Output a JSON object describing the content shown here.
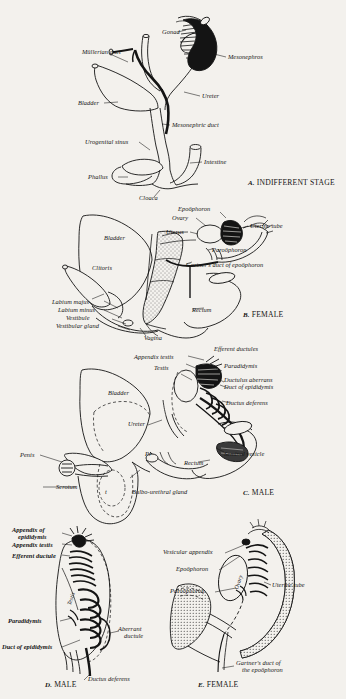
{
  "figure": {
    "background_color": "#f3f1ed",
    "ink_color": "#141414"
  },
  "panels": [
    {
      "id": "A",
      "caption_letter": "A.",
      "caption_text": "INDIFFERENT STAGE",
      "labels": [
        {
          "name": "gonad",
          "text": "Gonad"
        },
        {
          "name": "mullerian-duct",
          "text": "Müllerian duct"
        },
        {
          "name": "mesonephros",
          "text": "Mesonephros"
        },
        {
          "name": "bladder",
          "text": "Bladder"
        },
        {
          "name": "ureter",
          "text": "Ureter"
        },
        {
          "name": "mesonephric-duct",
          "text": "Mesonephric duct"
        },
        {
          "name": "urogenital-sinus",
          "text": "Urogenital sinus"
        },
        {
          "name": "intestine",
          "text": "Intestine"
        },
        {
          "name": "phallus",
          "text": "Phallus"
        },
        {
          "name": "cloaca",
          "text": "Cloaca"
        }
      ]
    },
    {
      "id": "B",
      "caption_letter": "B.",
      "caption_text": "FEMALE",
      "labels": [
        {
          "name": "epoophoron",
          "text": "Epoöphoron"
        },
        {
          "name": "ovary",
          "text": "Ovary"
        },
        {
          "name": "uterus",
          "text": "Uterus"
        },
        {
          "name": "uterine-tube",
          "text": "Uterine tube"
        },
        {
          "name": "bladder",
          "text": "Bladder"
        },
        {
          "name": "paroophoron",
          "text": "Paroöphoron"
        },
        {
          "name": "gartners-duct",
          "text": "Gartner's duct of epoöphoron"
        },
        {
          "name": "clitoris",
          "text": "Clitoris"
        },
        {
          "name": "rectum",
          "text": "Rectum"
        },
        {
          "name": "labium-majus",
          "text": "Labium majus"
        },
        {
          "name": "labium-minus",
          "text": "Labium minus"
        },
        {
          "name": "vestibule",
          "text": "Vestibule"
        },
        {
          "name": "vestibular-gland",
          "text": "Vestibular gland"
        },
        {
          "name": "vagina",
          "text": "Vagina"
        }
      ]
    },
    {
      "id": "C",
      "caption_letter": "C.",
      "caption_text": "MALE",
      "labels": [
        {
          "name": "appendix-testis",
          "text": "Appendix testis"
        },
        {
          "name": "efferent-ductules",
          "text": "Efferent ductules"
        },
        {
          "name": "paradidymis",
          "text": "Paradidymis"
        },
        {
          "name": "testis",
          "text": "Testis"
        },
        {
          "name": "ductulus-aberrans",
          "text": "Ductulus aberrans"
        },
        {
          "name": "duct-of-epididymis",
          "text": "Duct of epididymis"
        },
        {
          "name": "ductus-deferens",
          "text": "Ductus deferens"
        },
        {
          "name": "bladder",
          "text": "Bladder"
        },
        {
          "name": "ureter",
          "text": "Ureter"
        },
        {
          "name": "seminal-vesicle",
          "text": "Seminal vesicle"
        },
        {
          "name": "penis",
          "text": "Penis"
        },
        {
          "name": "prostate-marker",
          "text": "Pr"
        },
        {
          "name": "rectum",
          "text": "Rectum"
        },
        {
          "name": "scrotum",
          "text": "Scrotum"
        },
        {
          "name": "testis-marker",
          "text": "t"
        },
        {
          "name": "bulbo-urethral-gland",
          "text": "Bulbo-urethral gland"
        }
      ]
    },
    {
      "id": "D",
      "caption_letter": "D.",
      "caption_text": "MALE",
      "labels": [
        {
          "name": "appendix-of-epididymis",
          "text": "Appendix of\nepididymis"
        },
        {
          "name": "appendix-testis",
          "text": "Appendix testis"
        },
        {
          "name": "efferent-ductule",
          "text": "Efferent ductule"
        },
        {
          "name": "testis",
          "text": "Testis"
        },
        {
          "name": "paradidymis",
          "text": "Paradidymis"
        },
        {
          "name": "aberrant-ductule",
          "text": "Aberrant\nductule"
        },
        {
          "name": "duct-of-epididymis",
          "text": "Duct of epididymis"
        },
        {
          "name": "ductus-deferens",
          "text": "Ductus deferens"
        }
      ]
    },
    {
      "id": "E",
      "caption_letter": "E.",
      "caption_text": "FEMALE",
      "labels": [
        {
          "name": "vesicular-appendix",
          "text": "Vesicular appendix"
        },
        {
          "name": "epoophoron",
          "text": "Epoöphoron"
        },
        {
          "name": "ovary",
          "text": "Ovary"
        },
        {
          "name": "paroophoron",
          "text": "Paroöphoron"
        },
        {
          "name": "uterine-tube",
          "text": "Uterine tube"
        },
        {
          "name": "gartners-duct",
          "text": "Gartner's duct of\nthe epoöphoron"
        }
      ]
    }
  ]
}
